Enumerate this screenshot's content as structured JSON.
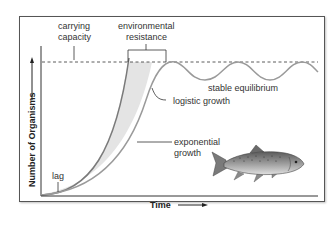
{
  "diagram": {
    "axes": {
      "y_label": "Number of Organisms",
      "x_label": "Time"
    },
    "labels": {
      "carrying_capacity": [
        "carrying",
        "capacity"
      ],
      "environmental_resistance": [
        "environmental",
        "resistance"
      ],
      "stable_equilibrium": "stable equilibrium",
      "logistic_growth": "logistic growth",
      "exponential_growth": [
        "exponential",
        "growth"
      ],
      "lag": "lag"
    },
    "illustration": "fish-icon (trout)",
    "colors": {
      "curve": "#8a8a8a",
      "shading": "#e6e6e6",
      "axis": "#333333",
      "frame": "#555555",
      "dashed_line": "#333333"
    }
  }
}
